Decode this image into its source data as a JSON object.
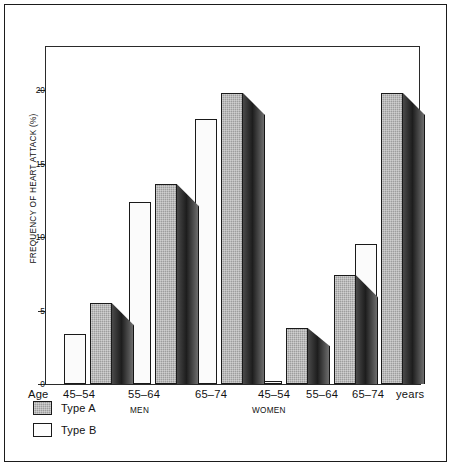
{
  "chart_data": {
    "type": "bar",
    "title": "",
    "xlabel": "Age",
    "ylabel": "FREQUENCY OF HEART ATTACK (%)",
    "ylim": [
      0,
      23
    ],
    "yticks": [
      0,
      5,
      10,
      15,
      20
    ],
    "ytick_labels": [
      "0",
      "5",
      "10",
      "15",
      "20"
    ],
    "grid": false,
    "legend_position": "bottom-left",
    "categories": [
      "45-54",
      "55-64",
      "65-74",
      "45-54",
      "55-64",
      "65-74"
    ],
    "groups": [
      {
        "name": "MEN",
        "categories": [
          "45-54",
          "55-64",
          "65-74"
        ]
      },
      {
        "name": "WOMEN",
        "categories": [
          "45-54",
          "55-64",
          "65-74"
        ]
      }
    ],
    "series": [
      {
        "name": "Type A",
        "color": "#9d9d9d",
        "values": [
          5.5,
          13.6,
          19.8,
          3.8,
          7.4,
          19.8
        ]
      },
      {
        "name": "Type B",
        "color": "#fbfbfb",
        "values": [
          3.4,
          12.4,
          18.0,
          0.2,
          2.1,
          9.5
        ]
      }
    ],
    "units_suffix": "years"
  },
  "axis": {
    "y_title": "FREQUENCY OF HEART ATTACK (%)",
    "ticks": [
      {
        "value": 20,
        "label": "20"
      },
      {
        "value": 15,
        "label": "15"
      },
      {
        "value": 10,
        "label": "10"
      },
      {
        "value": 5,
        "label": "5"
      },
      {
        "value": 0,
        "label": "0"
      }
    ]
  },
  "x_axis": {
    "age_prefix": "Age",
    "labels": [
      "45–54",
      "55–64",
      "65–74",
      "45–54",
      "55–64",
      "65–74"
    ],
    "trailing_unit": "years",
    "group_labels": [
      "MEN",
      "WOMEN"
    ]
  },
  "legend": {
    "items": [
      {
        "label": "Type A",
        "swatch": "type-a-swatch"
      },
      {
        "label": "Type B",
        "swatch": "type-b-swatch"
      }
    ]
  }
}
